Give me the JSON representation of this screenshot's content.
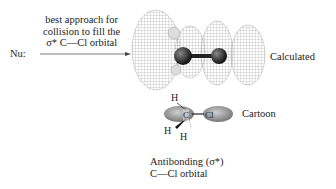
{
  "figure": {
    "nucleophile_label": "Nu:",
    "approach_lines": [
      "best approach for",
      "collision to fill the",
      "σ* C—Cl orbital"
    ],
    "calculated_label": "Calculated",
    "cartoon_label": "Cartoon",
    "caption_lines": [
      "Antibonding (σ*)",
      "C—Cl orbital"
    ],
    "cartoon_atoms": {
      "c": "C",
      "cl": "Cl",
      "h_top": "H",
      "h_left": "H",
      "h_right": "H"
    }
  }
}
